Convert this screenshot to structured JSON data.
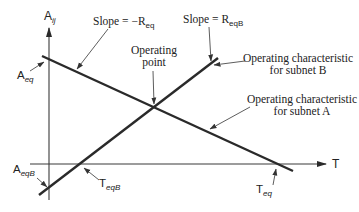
{
  "diagram": {
    "axes": {
      "y_label": "A",
      "y_label_sub": "ij",
      "x_label": "T"
    },
    "labels": {
      "slope_a": {
        "prefix": "Slope = −R",
        "sub": "eq"
      },
      "slope_b": {
        "prefix": "Slope = R",
        "sub": "eqB"
      },
      "operating_point_line1": "Operating",
      "operating_point_line2": "point",
      "subnet_b_line1": "Operating characteristic",
      "subnet_b_line2": "for subnet B",
      "subnet_a_line1": "Operating characteristic",
      "subnet_a_line2": "for subnet A",
      "a_eq": {
        "main": "A",
        "sub": "eq"
      },
      "a_eqb": {
        "main": "A",
        "sub": "eqB"
      },
      "t_eqb": {
        "main": "T",
        "sub": "eqB"
      },
      "t_eq": {
        "main": "T",
        "sub": "eq"
      }
    },
    "colors": {
      "line": "#2a2a2a",
      "axis": "#3a3a3a",
      "text": "#222222"
    }
  }
}
